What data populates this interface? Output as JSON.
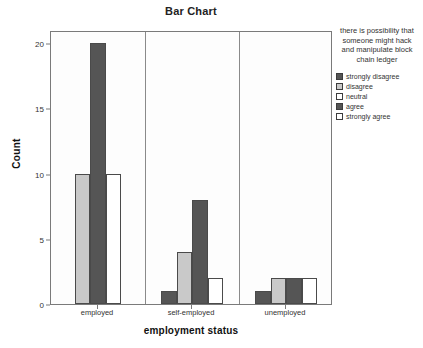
{
  "chart_data": {
    "type": "bar",
    "title": "Bar Chart",
    "xlabel": "employment status",
    "ylabel": "Count",
    "categories": [
      "employed",
      "self-employed",
      "unemployed"
    ],
    "ylim": [
      0,
      21
    ],
    "yticks": [
      0,
      5,
      10,
      15,
      20
    ],
    "ytick_labels": [
      "0",
      "5",
      "10",
      "15",
      "20"
    ],
    "grid": false,
    "legend_position": "right",
    "legend_title": "there is possibility that someone might hack and manipulate block chain ledger",
    "series": [
      {
        "name": "strongly disagree",
        "color": "#555555",
        "values": [
          0,
          1,
          1
        ]
      },
      {
        "name": "disagree",
        "color": "#c9c9c9",
        "values": [
          10,
          4,
          2
        ]
      },
      {
        "name": "neutral",
        "color": "#ffffff",
        "values": [
          0,
          0,
          0
        ]
      },
      {
        "name": "agree",
        "color": "#555555",
        "values": [
          20,
          8,
          2
        ]
      },
      {
        "name": "strongly agree",
        "color": "#ffffff",
        "values": [
          10,
          2,
          2
        ]
      }
    ]
  },
  "legend": {
    "title": "there is possibility that someone might hack and manipulate block chain ledger",
    "items": [
      {
        "label": "strongly disagree",
        "color": "#555555"
      },
      {
        "label": "disagree",
        "color": "#c9c9c9"
      },
      {
        "label": "neutral",
        "color": "#ffffff"
      },
      {
        "label": "agree",
        "color": "#555555"
      },
      {
        "label": "strongly agree",
        "color": "#ffffff"
      }
    ]
  },
  "colors": {
    "frame": "#7a7a7a",
    "bar_outline": "#4a4a4a",
    "plot_background": "#fdfdfd",
    "text": "#333333"
  }
}
